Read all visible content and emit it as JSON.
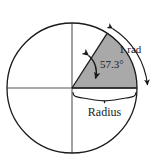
{
  "figure": {
    "background_color": "#ffffff",
    "stroke_color": "#1a1a1a",
    "axis_color": "#4d4d4d",
    "sector_fill_color": "#a9a9a9",
    "labels": {
      "angle": "57.3°",
      "arc": "1 rad",
      "radius": "Radius"
    },
    "geometry": {
      "center_x": 72,
      "center_y": 88,
      "radius": 65,
      "angle_degrees": 57.3,
      "circle_top_y": 23,
      "circle_bottom_y": 153,
      "circle_left_x": 7,
      "circle_right_x": 137
    },
    "icons": {
      "angle_arrow": "double-headed-curved-arrow",
      "arc_arrow": "double-headed-arc-arrow",
      "radius_brace": "curly-brace"
    }
  }
}
